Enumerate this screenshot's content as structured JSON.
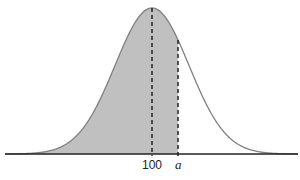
{
  "diagram": {
    "type": "normal-distribution-curve",
    "mean_label": "100",
    "point_label": "a",
    "shaded_region": "left tail up to a",
    "colors": {
      "shade": "#c0c0c0",
      "curve": "#808080",
      "axis": "#222222",
      "dash": "#222222"
    }
  }
}
